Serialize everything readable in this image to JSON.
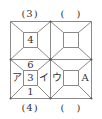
{
  "captions": {
    "top_left": "(3)",
    "top_right": "(　)",
    "bottom_left": "(4)",
    "bottom_right": "(　)"
  },
  "cells": {
    "top_left": {
      "top": "",
      "left": "",
      "center": "4",
      "right": "",
      "bottom": ""
    },
    "top_right": {
      "top": "",
      "left": "",
      "center": "",
      "right": "",
      "bottom": ""
    },
    "bottom_left": {
      "top": "6",
      "left": "ア",
      "center": "3",
      "right": "イ",
      "bottom": "1"
    },
    "bottom_right": {
      "top": "",
      "left": "ウ",
      "center": "",
      "right": "A",
      "bottom": ""
    }
  },
  "colors": {
    "line": "#8a8a8a",
    "dot": "#555555",
    "text": "#333333"
  }
}
